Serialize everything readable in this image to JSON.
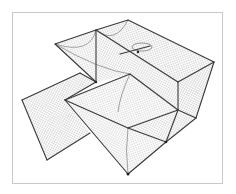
{
  "image": {
    "subject": "collapsible mesh fish trap net",
    "description": "Line illustration/photo of a rectangular folding crab/fish trap with netted mesh panels, funnel entrances and an open side flap",
    "colors": {
      "background": "#ffffff",
      "frame_border": "#c9c9c9",
      "wire_frame": "#3a3a3a",
      "mesh": "#8a8a8a"
    },
    "frame_lines": [
      [
        128,
        20,
        96,
        30
      ],
      [
        96,
        30,
        55,
        44
      ],
      [
        128,
        20,
        214,
        62
      ],
      [
        214,
        62,
        196,
        118
      ],
      [
        96,
        30,
        178,
        82
      ],
      [
        178,
        82,
        214,
        62
      ],
      [
        178,
        82,
        178,
        110
      ],
      [
        178,
        110,
        196,
        118
      ],
      [
        96,
        30,
        96,
        82
      ],
      [
        96,
        82,
        65,
        100
      ],
      [
        65,
        100,
        130,
        74
      ],
      [
        130,
        74,
        178,
        110
      ],
      [
        65,
        100,
        128,
        128
      ],
      [
        128,
        128,
        178,
        110
      ],
      [
        128,
        128,
        166,
        142
      ],
      [
        166,
        142,
        196,
        118
      ],
      [
        166,
        142,
        178,
        110
      ],
      [
        65,
        100,
        128,
        174
      ],
      [
        128,
        174,
        166,
        142
      ],
      [
        128,
        128,
        128,
        174
      ],
      [
        22,
        100,
        80,
        73
      ],
      [
        22,
        100,
        47,
        160
      ],
      [
        47,
        160,
        90,
        133
      ],
      [
        80,
        73,
        96,
        82
      ],
      [
        55,
        44,
        96,
        82
      ],
      [
        96,
        30,
        128,
        20
      ],
      [
        140,
        46,
        150,
        46
      ]
    ]
  }
}
